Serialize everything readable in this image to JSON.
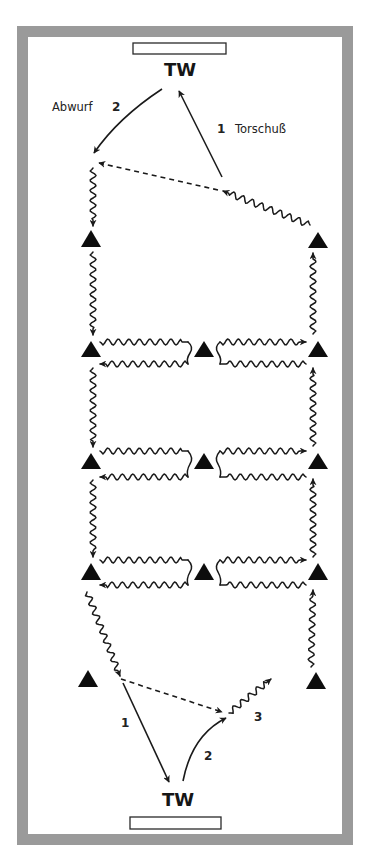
{
  "colors": {
    "frame": "#9a9a9a",
    "field": "#ffffff",
    "ink": "#1a1a1a",
    "player": "#0d0d0d"
  },
  "field": {
    "outer": {
      "x": 17,
      "y": 26,
      "w": 336,
      "h": 819
    },
    "border": 11
  },
  "goals": [
    {
      "name": "top-goal",
      "x": 133,
      "y": 43,
      "w": 93,
      "h": 11
    },
    {
      "name": "bottom-goal",
      "x": 130,
      "y": 817,
      "w": 91,
      "h": 12
    }
  ],
  "labels": {
    "tw_top": {
      "text": "TW",
      "x": 180,
      "y": 76
    },
    "tw_bottom": {
      "text": "TW",
      "x": 178,
      "y": 806
    },
    "abwurf": {
      "text": "Abwurf",
      "x": 52,
      "y": 111
    },
    "abwurf_num": {
      "text": "2",
      "x": 112,
      "y": 111
    },
    "torschuss_num": {
      "text": "1",
      "x": 217,
      "y": 133
    },
    "torschuss": {
      "text": "Torschuß",
      "x": 235,
      "y": 133
    },
    "bottom_num_1": {
      "text": "1",
      "x": 121,
      "y": 727
    },
    "bottom_num_2": {
      "text": "2",
      "x": 204,
      "y": 760
    },
    "bottom_num_3": {
      "text": "3",
      "x": 254,
      "y": 721
    }
  },
  "players": [
    {
      "name": "player-left-top",
      "cx": 91,
      "apex": 230,
      "base": 247,
      "half": 10
    },
    {
      "name": "player-right-top",
      "cx": 318,
      "apex": 232,
      "base": 248,
      "half": 10
    },
    {
      "name": "player-left-row1",
      "cx": 91,
      "apex": 341,
      "base": 357,
      "half": 10
    },
    {
      "name": "player-center-row1",
      "cx": 204,
      "apex": 341,
      "base": 357,
      "half": 10
    },
    {
      "name": "player-right-row1",
      "cx": 318,
      "apex": 341,
      "base": 357,
      "half": 10
    },
    {
      "name": "player-left-row2",
      "cx": 91,
      "apex": 453,
      "base": 469,
      "half": 10
    },
    {
      "name": "player-center-row2",
      "cx": 204,
      "apex": 453,
      "base": 469,
      "half": 10
    },
    {
      "name": "player-right-row2",
      "cx": 318,
      "apex": 453,
      "base": 469,
      "half": 10
    },
    {
      "name": "player-left-row3",
      "cx": 91,
      "apex": 563,
      "base": 580,
      "half": 10
    },
    {
      "name": "player-center-row3",
      "cx": 204,
      "apex": 563,
      "base": 580,
      "half": 10
    },
    {
      "name": "player-right-row3",
      "cx": 318,
      "apex": 563,
      "base": 580,
      "half": 10
    },
    {
      "name": "player-left-bottom",
      "cx": 88,
      "apex": 670,
      "base": 687,
      "half": 10
    },
    {
      "name": "player-right-bottom",
      "cx": 316,
      "apex": 672,
      "base": 689,
      "half": 10
    }
  ],
  "passes": [
    {
      "name": "torschuss-arrow",
      "style": "solid",
      "d": "M222,177 L179,91",
      "arrow": true
    },
    {
      "name": "abwurf-arrow",
      "style": "solid",
      "d": "M162,89 Q118,118 94,153",
      "arrow": true
    },
    {
      "name": "top-dashed-pass",
      "style": "dashed",
      "d": "M218,190 L99,163",
      "arrow": true
    },
    {
      "name": "bottom-shot-arrow-1",
      "style": "solid",
      "d": "M123,683 L169,782",
      "arrow": true
    },
    {
      "name": "bottom-throw-arrow-2",
      "style": "solid",
      "d": "M183,781 Q192,735 226,718",
      "arrow": true
    },
    {
      "name": "bottom-dashed-pass",
      "style": "dashed",
      "d": "M121,679 L222,712",
      "arrow": true
    }
  ],
  "dribbles": [
    {
      "name": "dribble-right-to-shot",
      "x1": 310,
      "y1": 225,
      "x2": 223,
      "y2": 191,
      "arrow": true,
      "amp": 3.2,
      "wl": 10
    },
    {
      "name": "dribble-left-top-down",
      "x1": 93,
      "y1": 168,
      "x2": 93,
      "y2": 226,
      "arrow": true,
      "amp": 3,
      "wl": 10
    },
    {
      "name": "dribble-left-down-1",
      "x1": 93,
      "y1": 252,
      "x2": 93,
      "y2": 335,
      "arrow": true,
      "amp": 3,
      "wl": 10
    },
    {
      "name": "dribble-right-up-1",
      "x1": 313,
      "y1": 334,
      "x2": 313,
      "y2": 253,
      "arrow": true,
      "amp": 3,
      "wl": 10
    },
    {
      "name": "dribble-row1-left-out",
      "x1": 100,
      "y1": 342,
      "x2": 188,
      "y2": 342,
      "arrow": false,
      "amp": 3,
      "wl": 10.5
    },
    {
      "name": "dribble-row1-left-back",
      "x1": 188,
      "y1": 364,
      "x2": 100,
      "y2": 364,
      "arrow": true,
      "amp": 3,
      "wl": 10.5
    },
    {
      "name": "dribble-row1-right-out",
      "x1": 220,
      "y1": 342,
      "x2": 306,
      "y2": 342,
      "arrow": true,
      "amp": 3,
      "wl": 10.5
    },
    {
      "name": "dribble-row1-right-back",
      "x1": 306,
      "y1": 364,
      "x2": 220,
      "y2": 364,
      "arrow": false,
      "amp": 3,
      "wl": 10.5
    },
    {
      "name": "dribble-left-down-2",
      "x1": 93,
      "y1": 368,
      "x2": 93,
      "y2": 447,
      "arrow": true,
      "amp": 3,
      "wl": 10
    },
    {
      "name": "dribble-right-up-2",
      "x1": 313,
      "y1": 446,
      "x2": 313,
      "y2": 368,
      "arrow": true,
      "amp": 3,
      "wl": 10
    },
    {
      "name": "dribble-row2-left-out",
      "x1": 100,
      "y1": 451,
      "x2": 188,
      "y2": 451,
      "arrow": false,
      "amp": 3,
      "wl": 10.5
    },
    {
      "name": "dribble-row2-left-back",
      "x1": 188,
      "y1": 477,
      "x2": 100,
      "y2": 477,
      "arrow": true,
      "amp": 3,
      "wl": 10.5
    },
    {
      "name": "dribble-row2-right-out",
      "x1": 220,
      "y1": 451,
      "x2": 306,
      "y2": 451,
      "arrow": true,
      "amp": 3,
      "wl": 10.5
    },
    {
      "name": "dribble-row2-right-back",
      "x1": 306,
      "y1": 477,
      "x2": 220,
      "y2": 477,
      "arrow": false,
      "amp": 3,
      "wl": 10.5
    },
    {
      "name": "dribble-left-down-3",
      "x1": 93,
      "y1": 480,
      "x2": 93,
      "y2": 557,
      "arrow": true,
      "amp": 3,
      "wl": 10
    },
    {
      "name": "dribble-right-up-3",
      "x1": 313,
      "y1": 557,
      "x2": 313,
      "y2": 479,
      "arrow": true,
      "amp": 3,
      "wl": 10
    },
    {
      "name": "dribble-row3-left-out",
      "x1": 100,
      "y1": 560,
      "x2": 188,
      "y2": 560,
      "arrow": false,
      "amp": 3,
      "wl": 10.5
    },
    {
      "name": "dribble-row3-left-back",
      "x1": 188,
      "y1": 585,
      "x2": 100,
      "y2": 585,
      "arrow": true,
      "amp": 3,
      "wl": 10.5
    },
    {
      "name": "dribble-row3-right-out",
      "x1": 220,
      "y1": 560,
      "x2": 306,
      "y2": 560,
      "arrow": true,
      "amp": 3,
      "wl": 10.5
    },
    {
      "name": "dribble-row3-right-back",
      "x1": 306,
      "y1": 585,
      "x2": 220,
      "y2": 585,
      "arrow": false,
      "amp": 3,
      "wl": 10.5
    },
    {
      "name": "dribble-left-to-bottom",
      "x1": 87,
      "y1": 592,
      "x2": 120,
      "y2": 676,
      "arrow": true,
      "amp": 3,
      "wl": 10
    },
    {
      "name": "dribble-right-bottom-up",
      "x1": 311,
      "y1": 667,
      "x2": 313,
      "y2": 590,
      "arrow": true,
      "amp": 3,
      "wl": 10
    },
    {
      "name": "dribble-bottom-3",
      "x1": 229,
      "y1": 713,
      "x2": 271,
      "y2": 679,
      "arrow": true,
      "amp": 3,
      "wl": 10
    }
  ],
  "connectors": [
    {
      "name": "row1-left-connector",
      "d": "M188,342 Q194,347 190,353 Q186,359 188,364"
    },
    {
      "name": "row1-right-connector",
      "d": "M220,342 Q214,347 218,353 Q222,359 220,364"
    },
    {
      "name": "row2-left-connector",
      "d": "M188,451 Q194,458 190,464 Q186,471 188,477"
    },
    {
      "name": "row2-right-connector",
      "d": "M220,451 Q214,458 218,464 Q222,471 220,477"
    },
    {
      "name": "row3-left-connector",
      "d": "M188,560 Q194,566 190,572 Q186,579 188,585"
    },
    {
      "name": "row3-right-connector",
      "d": "M220,560 Q214,566 218,572 Q222,579 220,585"
    }
  ]
}
